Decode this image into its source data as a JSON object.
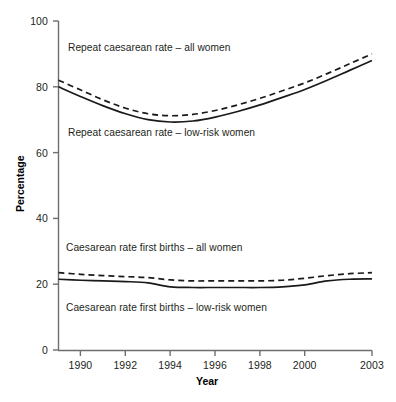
{
  "chart_data": {
    "type": "line",
    "title": "",
    "xlabel": "Year",
    "ylabel": "Percentage",
    "xlim": [
      1989,
      2003
    ],
    "ylim": [
      0,
      100
    ],
    "grid": false,
    "legend_position": "inline-annotations",
    "x_ticks": [
      "1990",
      "1992",
      "1994",
      "1996",
      "1998",
      "2000",
      "2003"
    ],
    "x_tick_values": [
      1990,
      1992,
      1994,
      1996,
      1998,
      2000,
      2003
    ],
    "y_ticks": [
      "0",
      "20",
      "40",
      "60",
      "80",
      "100"
    ],
    "y_tick_values": [
      0,
      20,
      40,
      60,
      80,
      100
    ],
    "x": [
      1989,
      1990,
      1991,
      1992,
      1993,
      1994,
      1995,
      1996,
      1997,
      1998,
      1999,
      2000,
      2001,
      2002,
      2003
    ],
    "series": [
      {
        "name": "Repeat caesarean rate – all women",
        "style": "dashed",
        "color": "#1a1a1a",
        "values": [
          82.0,
          79.0,
          76.0,
          73.5,
          71.8,
          71.2,
          71.6,
          72.8,
          74.5,
          76.5,
          78.8,
          81.2,
          84.0,
          87.0,
          90.0
        ]
      },
      {
        "name": "Repeat caesarean rate – low-risk women",
        "style": "solid",
        "color": "#1a1a1a",
        "values": [
          80.0,
          77.0,
          74.2,
          71.8,
          70.0,
          69.3,
          69.6,
          70.8,
          72.5,
          74.5,
          76.8,
          79.2,
          82.0,
          85.0,
          88.0
        ]
      },
      {
        "name": "Caesarean rate first births – all women",
        "style": "dashed",
        "color": "#1a1a1a",
        "values": [
          23.5,
          23.0,
          22.6,
          22.3,
          22.0,
          21.3,
          21.0,
          21.0,
          21.0,
          21.0,
          21.2,
          21.8,
          22.6,
          23.2,
          23.5
        ]
      },
      {
        "name": "Caesarean rate first births – low-risk women",
        "style": "solid",
        "color": "#1a1a1a",
        "values": [
          21.5,
          21.2,
          21.0,
          20.8,
          20.4,
          19.2,
          19.0,
          19.0,
          19.0,
          19.0,
          19.2,
          19.8,
          21.0,
          21.5,
          21.6
        ]
      }
    ],
    "annotations": [
      {
        "text": "Repeat caesarean rate – all women",
        "x_px": 68,
        "y_px": 42
      },
      {
        "text": "Repeat caesarean rate – low-risk women",
        "x_px": 68,
        "y_px": 127
      },
      {
        "text": "Caesarean rate first births – all women",
        "x_px": 66,
        "y_px": 242
      },
      {
        "text": "Caesarean rate first births – low-risk women",
        "x_px": 66,
        "y_px": 302
      }
    ]
  }
}
